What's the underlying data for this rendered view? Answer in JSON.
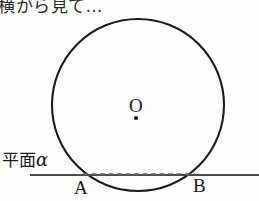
{
  "figure": {
    "caption_top": "横から見て…",
    "background_color": "#fdfdfb",
    "ink_color": "#1a1a1a",
    "width": 259,
    "height": 201
  },
  "labels": {
    "plane_text": "平面",
    "plane_symbol": "α",
    "center_point": "O",
    "tangent_left": "A",
    "tangent_right": "B"
  },
  "geometry": {
    "circle": {
      "cx": 138,
      "cy": 105,
      "r": 86,
      "stroke": "#1a1a1a",
      "stroke_width": 2.1,
      "fill": "none"
    },
    "center_dot": {
      "cx": 136,
      "cy": 118,
      "r": 2.1,
      "fill": "#1a1a1a"
    },
    "plane_line": {
      "x1": 30,
      "y1": 175,
      "x2": 259,
      "y2": 175,
      "stroke": "#4a4a4a",
      "stroke_width": 2.0
    },
    "chord_AB": {
      "x1": 83,
      "y1": 174,
      "x2": 195,
      "y2": 174,
      "stroke": "#6a6a6a",
      "stroke_width": 1.3,
      "dash": "5 3.5"
    },
    "point_A": {
      "x": 83,
      "y": 175
    },
    "point_B": {
      "x": 195,
      "y": 175
    }
  }
}
